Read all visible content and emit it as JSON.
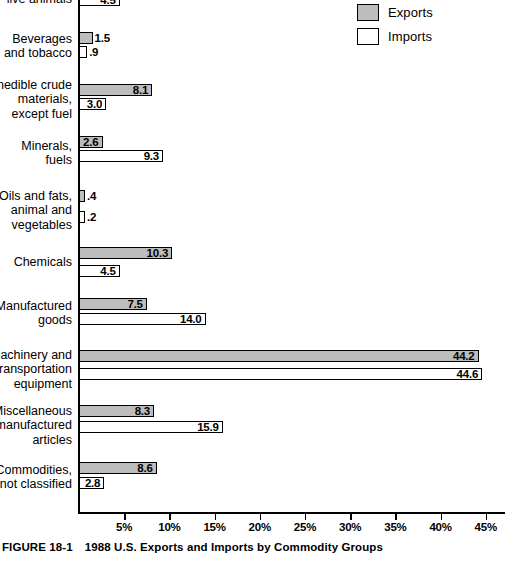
{
  "figure": {
    "number": "FIGURE 18-1",
    "caption": "1988 U.S. Exports and Imports by Commodity Groups"
  },
  "legend": {
    "position": "top-right",
    "entries": [
      {
        "label": "Exports",
        "swatch": "filled-gray",
        "color": "#bdbdbd"
      },
      {
        "label": "Imports",
        "swatch": "empty-white",
        "color": "#ffffff"
      }
    ]
  },
  "axis": {
    "ticks": [
      "5%",
      "10%",
      "15%",
      "20%",
      "25%",
      "30%",
      "35%",
      "40%",
      "45%"
    ],
    "tick_values": [
      5,
      10,
      15,
      20,
      25,
      30,
      35,
      40,
      45
    ],
    "min": 0,
    "max": 47
  },
  "chart_data": {
    "type": "bar",
    "orientation": "horizontal",
    "title": "1988 U.S. Exports and Imports by Commodity Groups",
    "xlabel": "",
    "ylabel": "",
    "xlim": [
      0,
      47
    ],
    "grid": false,
    "legend_position": "top-right",
    "categories": [
      "live animals",
      "Beverages\nand tobacco",
      "Inedible crude\nmaterials,\nexcept fuel",
      "Minerals,\nfuels",
      "Oils and fats,\nanimal and\nvegetables",
      "Chemicals",
      "Manufactured\ngoods",
      "Machinery and\ntransportation\nequipment",
      "Miscellaneous\nmanufactured\narticles",
      "Commodities,\nnot classified"
    ],
    "series": [
      {
        "name": "Exports",
        "color": "#bdbdbd",
        "values": [
          null,
          1.5,
          8.1,
          2.6,
          0.4,
          10.3,
          7.5,
          44.2,
          8.3,
          8.6
        ],
        "labels": [
          "",
          "1.5",
          "8.1",
          "2.6",
          ".4",
          "10.3",
          "7.5",
          "44.2",
          "8.3",
          "8.6"
        ]
      },
      {
        "name": "Imports",
        "color": "#ffffff",
        "values": [
          4.5,
          0.9,
          3.0,
          9.3,
          0.2,
          4.5,
          14.0,
          44.6,
          15.9,
          2.8
        ],
        "labels": [
          "4.5",
          ".9",
          "3.0",
          "9.3",
          ".2",
          "4.5",
          "14.0",
          "44.6",
          "15.9",
          "2.8"
        ]
      }
    ]
  },
  "rows": [
    {
      "label": "live animals",
      "label_top": -8,
      "row_top": 0,
      "exports": null,
      "imports": {
        "value": 4.5,
        "label": "4.5",
        "placement": "inside",
        "top": -6
      }
    },
    {
      "label": "Beverages\nand tobacco",
      "label_top": 32,
      "row_top": 32,
      "exports": {
        "value": 1.5,
        "label": "1.5",
        "placement": "outside",
        "top": 32
      },
      "imports": {
        "value": 0.9,
        "label": ".9",
        "placement": "outside",
        "top": 46
      }
    },
    {
      "label": "Inedible crude\nmaterials,\nexcept fuel",
      "label_top": 78,
      "row_top": 84,
      "exports": {
        "value": 8.1,
        "label": "8.1",
        "placement": "inside",
        "top": 84
      },
      "imports": {
        "value": 3.0,
        "label": "3.0",
        "placement": "inside",
        "top": 98
      }
    },
    {
      "label": "Minerals,\nfuels",
      "label_top": 139,
      "row_top": 136,
      "exports": {
        "value": 2.6,
        "label": "2.6",
        "placement": "inside",
        "top": 136
      },
      "imports": {
        "value": 9.3,
        "label": "9.3",
        "placement": "inside",
        "top": 150
      }
    },
    {
      "label": "Oils and fats,\nanimal and\nvegetables",
      "label_top": 189,
      "row_top": 190,
      "exports": {
        "value": 0.4,
        "label": ".4",
        "placement": "outside",
        "top": 190
      },
      "imports": {
        "value": 0.2,
        "label": ".2",
        "placement": "outside",
        "top": 211
      }
    },
    {
      "label": "Chemicals",
      "label_top": 255,
      "row_top": 247,
      "exports": {
        "value": 10.3,
        "label": "10.3",
        "placement": "inside",
        "top": 247
      },
      "imports": {
        "value": 4.5,
        "label": "4.5",
        "placement": "inside",
        "top": 265
      }
    },
    {
      "label": "Manufactured\ngoods",
      "label_top": 299,
      "row_top": 298,
      "exports": {
        "value": 7.5,
        "label": "7.5",
        "placement": "inside",
        "top": 298
      },
      "imports": {
        "value": 14.0,
        "label": "14.0",
        "placement": "inside",
        "top": 313
      }
    },
    {
      "label": "Machinery and\ntransportation\nequipment",
      "label_top": 348,
      "row_top": 350,
      "exports": {
        "value": 44.2,
        "label": "44.2",
        "placement": "inside",
        "top": 350
      },
      "imports": {
        "value": 44.6,
        "label": "44.6",
        "placement": "inside",
        "top": 368
      }
    },
    {
      "label": "Miscellaneous\nmanufactured\narticles",
      "label_top": 404,
      "row_top": 405,
      "exports": {
        "value": 8.3,
        "label": "8.3",
        "placement": "inside",
        "top": 405
      },
      "imports": {
        "value": 15.9,
        "label": "15.9",
        "placement": "inside",
        "top": 421
      }
    },
    {
      "label": "Commodities,\nnot classified",
      "label_top": 463,
      "row_top": 462,
      "exports": {
        "value": 8.6,
        "label": "8.6",
        "placement": "inside",
        "top": 462
      },
      "imports": {
        "value": 2.8,
        "label": "2.8",
        "placement": "inside",
        "top": 477
      }
    }
  ]
}
